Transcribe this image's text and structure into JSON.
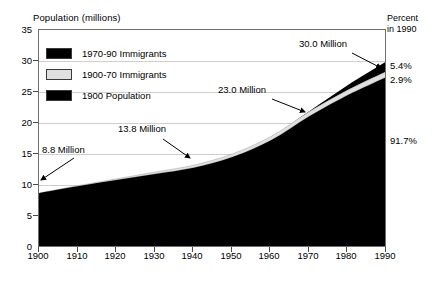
{
  "chart_data": {
    "type": "area",
    "title": "",
    "ylabel": "Population (millions)",
    "xlabel": "",
    "ylim": [
      0,
      35
    ],
    "xlim": [
      1900,
      1990
    ],
    "grid": true,
    "stacked": true,
    "legend_position": "inside-top-left",
    "x": [
      1900,
      1910,
      1920,
      1930,
      1940,
      1950,
      1960,
      1970,
      1980,
      1990
    ],
    "xticks": [
      "1900",
      "1910",
      "1920",
      "1930",
      "1940",
      "1950",
      "1960",
      "1970",
      "1980",
      "1990"
    ],
    "yticks": [
      "0",
      "5",
      "10",
      "15",
      "20",
      "25",
      "30",
      "35"
    ],
    "series": [
      {
        "name": "1900 Population",
        "color": "#000000",
        "values": [
          8.8,
          9.9,
          10.9,
          11.9,
          12.9,
          14.6,
          17.3,
          21.2,
          24.6,
          27.5
        ]
      },
      {
        "name": "1900-70 Immigrants",
        "color": "#e0e0e0",
        "values": [
          0.0,
          0.1,
          0.2,
          0.3,
          0.4,
          0.5,
          0.6,
          0.7,
          0.8,
          0.87
        ]
      },
      {
        "name": "1970-90 Immigrants",
        "color": "#000000",
        "values": [
          0.0,
          0.0,
          0.0,
          0.0,
          0.0,
          0.0,
          0.0,
          0.1,
          0.8,
          1.63
        ]
      }
    ],
    "totals": [
      8.8,
      10.0,
      11.1,
      12.2,
      13.3,
      15.1,
      17.9,
      22.0,
      26.2,
      30.0
    ],
    "annotations": [
      {
        "text": "8.8 Million",
        "year": 1900,
        "value": 8.8
      },
      {
        "text": "13.8 Million",
        "year": 1940,
        "value": 13.8
      },
      {
        "text": "23.0 Million",
        "year": 1970,
        "value": 23.0
      },
      {
        "text": "30.0 Million",
        "year": 1990,
        "value": 30.0
      }
    ]
  },
  "axes": {
    "y_title": "Population (millions)",
    "y_ticks": [
      "35",
      "30",
      "25",
      "20",
      "15",
      "10",
      "5",
      "0"
    ],
    "x_ticks": [
      "1900",
      "1910",
      "1920",
      "1930",
      "1940",
      "1950",
      "1960",
      "1970",
      "1980",
      "1990"
    ]
  },
  "legend": {
    "items": [
      {
        "label": "1970-90 Immigrants",
        "color": "#000000"
      },
      {
        "label": "1900-70 Immigrants",
        "color": "#e0e0e0"
      },
      {
        "label": "1900 Population",
        "color": "#000000"
      }
    ]
  },
  "annotations": {
    "a1": "8.8 Million",
    "a2": "13.8 Million",
    "a3": "23.0 Million",
    "a4": "30.0 Million"
  },
  "right_panel": {
    "header_line1": "Percent",
    "header_line2": "in 1990",
    "percents": [
      {
        "label": "5.4%",
        "series": "1970-90 Immigrants"
      },
      {
        "label": "2.9%",
        "series": "1900-70 Immigrants"
      },
      {
        "label": "91.7%",
        "series": "1900 Population"
      }
    ]
  },
  "colors": {
    "ink": "#000000",
    "grid": "#cfcfcf",
    "frame": "#6f6f6f",
    "band_gray": "#e0e0e0"
  }
}
